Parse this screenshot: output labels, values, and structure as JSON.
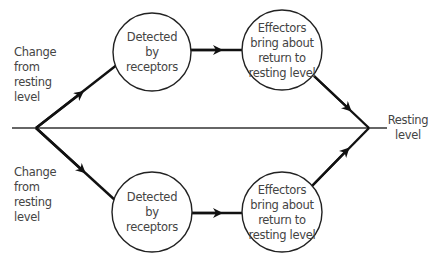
{
  "diagram": {
    "type": "flow",
    "baseline_label": [
      "Resting",
      "level"
    ],
    "upper_branch": {
      "start_label": [
        "Change",
        "from",
        "resting",
        "level"
      ],
      "node1": [
        "Detected",
        "by",
        "receptors"
      ],
      "node2": [
        "Effectors",
        "bring about",
        "return to",
        "resting level"
      ]
    },
    "lower_branch": {
      "start_label": [
        "Change",
        "from",
        "resting",
        "level"
      ],
      "node1": [
        "Detected",
        "by",
        "receptors"
      ],
      "node2": [
        "Effectors",
        "bring about",
        "return to",
        "resting level"
      ]
    },
    "colors": {
      "line": "#111111",
      "text": "#444444",
      "baseline": "#333333"
    }
  }
}
